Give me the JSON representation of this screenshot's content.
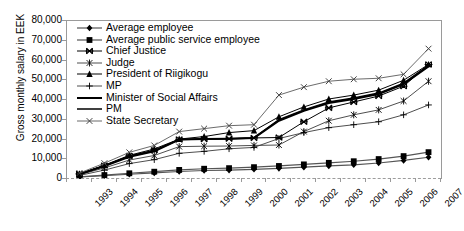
{
  "chart_data": {
    "type": "line",
    "title": "",
    "xlabel": "",
    "ylabel": "Gross monthly salary in EEK",
    "categories": [
      "1993",
      "1994",
      "1995",
      "1996",
      "1997",
      "1998",
      "1999",
      "2000",
      "2001",
      "2002",
      "2003",
      "2004",
      "2005",
      "2006",
      "2007"
    ],
    "ylim": [
      0,
      80000
    ],
    "ytick_values": [
      0,
      10000,
      20000,
      30000,
      40000,
      50000,
      60000,
      70000,
      80000
    ],
    "ytick_labels": [
      "0",
      "10,000",
      "20,000",
      "30,000",
      "40,000",
      "50,000",
      "60,000",
      "70,000",
      "80,000"
    ],
    "grid": false,
    "legend_position": "upper-left-inside",
    "series": [
      {
        "name": "Average employee",
        "marker": "diamond",
        "values": [
          1000,
          1700,
          2400,
          3100,
          3800,
          4300,
          4500,
          4900,
          5400,
          6000,
          6600,
          7200,
          8100,
          9400,
          11000
        ]
      },
      {
        "name": "Average public service employee",
        "marker": "square",
        "values": [
          1100,
          2000,
          2900,
          3700,
          4600,
          5200,
          5500,
          6000,
          6600,
          7400,
          8200,
          9000,
          10100,
          11600,
          13600
        ]
      },
      {
        "name": "Chief Justice",
        "marker": "bowtie",
        "values": [
          2600,
          6800,
          11700,
          14600,
          20000,
          20200,
          20400,
          20800,
          21000,
          29000,
          36000,
          39000,
          42000,
          47000,
          58000
        ]
      },
      {
        "name": "Judge",
        "marker": "asterisk",
        "values": [
          2200,
          5600,
          9600,
          11900,
          16400,
          16600,
          16700,
          17000,
          17200,
          24000,
          29500,
          32500,
          35000,
          39500,
          49500
        ]
      },
      {
        "name": "President of Riigikogu",
        "marker": "triangle",
        "values": [
          2600,
          7000,
          12000,
          15200,
          20200,
          21500,
          23500,
          24500,
          31500,
          36500,
          40500,
          42500,
          45000,
          50000,
          58000
        ]
      },
      {
        "name": "MP",
        "marker": "plus",
        "values": [
          1800,
          4500,
          7800,
          9800,
          13000,
          14000,
          15300,
          16000,
          20500,
          23500,
          26000,
          27500,
          29000,
          32500,
          37500
        ]
      },
      {
        "name": "Minister of Social Affairs",
        "marker": "none-thick",
        "values": [
          2400,
          6500,
          11200,
          14000,
          20000,
          20200,
          20400,
          20800,
          29500,
          34500,
          38500,
          40500,
          43000,
          48000,
          57000
        ]
      },
      {
        "name": "PM",
        "marker": "none-medium",
        "values": [
          2500,
          6700,
          11500,
          14300,
          20000,
          20200,
          20400,
          20800,
          30000,
          35000,
          39000,
          41000,
          43500,
          48500,
          57500
        ]
      },
      {
        "name": "State Secretary",
        "marker": "cross",
        "values": [
          3000,
          8000,
          13500,
          17000,
          24000,
          25500,
          27000,
          27500,
          42500,
          46500,
          49500,
          50500,
          51000,
          53000,
          66000
        ]
      }
    ]
  }
}
